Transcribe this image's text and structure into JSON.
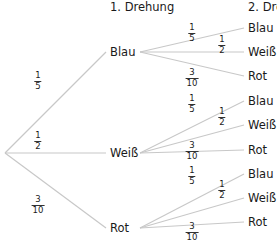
{
  "headers": {
    "first": "1. Drehung",
    "second": "2. Drehung"
  },
  "colors": {
    "line": "#c8c8c8",
    "text": "#1a1a1a",
    "background": "#ffffff"
  },
  "root": {
    "x": 5,
    "y": 153
  },
  "level1": [
    {
      "label": "Blau",
      "x": 110,
      "y": 52,
      "prob": {
        "num": "1",
        "den": "5"
      },
      "prob_pos": {
        "x": 38,
        "y": 81
      }
    },
    {
      "label": "Weiß",
      "x": 110,
      "y": 153,
      "prob": {
        "num": "1",
        "den": "2"
      },
      "prob_pos": {
        "x": 38,
        "y": 141
      }
    },
    {
      "label": "Rot",
      "x": 110,
      "y": 228,
      "prob": {
        "num": "3",
        "den": "10"
      },
      "prob_pos": {
        "x": 38,
        "y": 205
      }
    }
  ],
  "level2": [
    {
      "parent": 0,
      "children": [
        {
          "label": "Blau",
          "x": 248,
          "y": 28,
          "prob": {
            "num": "1",
            "den": "5"
          },
          "prob_pos": {
            "x": 192,
            "y": 33
          }
        },
        {
          "label": "Weiß",
          "x": 248,
          "y": 52,
          "prob": {
            "num": "1",
            "den": "2"
          },
          "prob_pos": {
            "x": 222,
            "y": 45
          }
        },
        {
          "label": "Rot",
          "x": 248,
          "y": 76,
          "prob": {
            "num": "3",
            "den": "10"
          },
          "prob_pos": {
            "x": 192,
            "y": 78
          }
        }
      ]
    },
    {
      "parent": 1,
      "children": [
        {
          "label": "Blau",
          "x": 248,
          "y": 101,
          "prob": {
            "num": "1",
            "den": "5"
          },
          "prob_pos": {
            "x": 192,
            "y": 104
          }
        },
        {
          "label": "Weiß",
          "x": 248,
          "y": 125,
          "prob": {
            "num": "1",
            "den": "2"
          },
          "prob_pos": {
            "x": 222,
            "y": 117
          }
        },
        {
          "label": "Rot",
          "x": 248,
          "y": 150,
          "prob": {
            "num": "3",
            "den": "10"
          },
          "prob_pos": {
            "x": 192,
            "y": 151
          }
        }
      ]
    },
    {
      "parent": 2,
      "children": [
        {
          "label": "Blau",
          "x": 248,
          "y": 174,
          "prob": {
            "num": "1",
            "den": "5"
          },
          "prob_pos": {
            "x": 192,
            "y": 176
          }
        },
        {
          "label": "Weiß",
          "x": 248,
          "y": 198,
          "prob": {
            "num": "1",
            "den": "2"
          },
          "prob_pos": {
            "x": 222,
            "y": 190
          }
        },
        {
          "label": "Rot",
          "x": 248,
          "y": 222,
          "prob": {
            "num": "3",
            "den": "10"
          },
          "prob_pos": {
            "x": 192,
            "y": 232
          }
        }
      ]
    }
  ]
}
